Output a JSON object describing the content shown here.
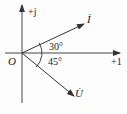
{
  "diagram": {
    "type": "phasor-diagram",
    "axes": {
      "imaginary_label": "+j",
      "real_label": "+1",
      "origin_label": "O"
    },
    "phasors": [
      {
        "name": "current",
        "label": "İ",
        "angle_deg": 30
      },
      {
        "name": "voltage",
        "label": "U̇",
        "angle_deg": -45
      }
    ],
    "angles": {
      "upper_label": "30°",
      "lower_label": "45°"
    },
    "colors": {
      "line": "#333333",
      "text": "#222222",
      "background": "#fdfdfd"
    }
  }
}
